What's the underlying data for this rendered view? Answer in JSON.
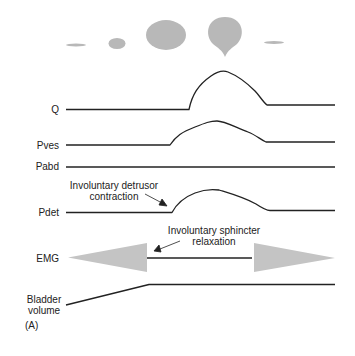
{
  "diagram": {
    "traces": [
      {
        "label": "Q"
      },
      {
        "label": "Pves"
      },
      {
        "label": "Pabd"
      },
      {
        "label": "Pdet"
      },
      {
        "label": "EMG"
      },
      {
        "label": "Bladder volume",
        "line1": "Bladder",
        "line2": "volume"
      }
    ],
    "annotations": {
      "detrusor": {
        "line1": "Involuntary detrusor",
        "line2": "contraction"
      },
      "sphincter": {
        "line1": "Involuntary sphincter",
        "line2": "relaxation"
      }
    },
    "panel_label": "(A)",
    "stream_drops": [
      "thin-stream",
      "small-drop",
      "large-drop",
      "teardrop",
      "thin-stream"
    ],
    "colors": {
      "line": "#222222",
      "drop": "#b8b8b8",
      "emg": "#c4c4c4"
    }
  }
}
